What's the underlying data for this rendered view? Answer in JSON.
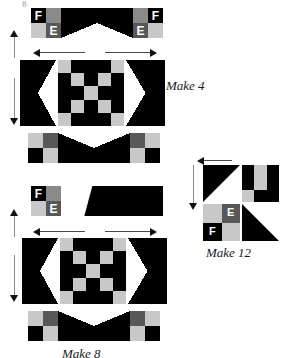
{
  "page": {
    "background": "#ffffff",
    "width": 286,
    "height": 358,
    "corner_mark": "8"
  },
  "palette": {
    "black": "#000000",
    "white": "#ffffff",
    "light_gray": "#c8c8c8",
    "medium_gray": "#8a8a8a",
    "dark_gray": "#585858",
    "arrow": "#111111",
    "caption_text": "#1a1a1a"
  },
  "patch_labels": {
    "f": "F",
    "e": "E"
  },
  "blocks": [
    {
      "id": "make-4",
      "caption": "Make 4",
      "rows": [
        {
          "name": "top-sashing-strip",
          "segments": [
            "four-patch-FE",
            "flying-geese-down",
            "four-patch-FE-mirrored"
          ]
        },
        {
          "name": "center-row",
          "segments": [
            "flying-geese-right",
            "checkerboard-5x5",
            "flying-geese-left"
          ]
        },
        {
          "name": "bottom-sashing-strip",
          "segments": [
            "four-patch",
            "flying-geese-up",
            "four-patch"
          ]
        }
      ]
    },
    {
      "id": "make-8",
      "caption": "Make 8",
      "rows": [
        {
          "name": "top-sashing-strip",
          "segments": [
            "four-patch-FE",
            "long-diagonal-black"
          ]
        },
        {
          "name": "center-row",
          "segments": [
            "flying-geese-right",
            "checkerboard-5x5",
            "flying-geese-left"
          ]
        },
        {
          "name": "bottom-sashing-strip",
          "segments": [
            "four-patch",
            "flying-geese-up",
            "four-patch"
          ]
        }
      ]
    },
    {
      "id": "make-12",
      "caption": "Make 12",
      "rows": [
        {
          "name": "top-row",
          "segments": [
            "half-square-triangle",
            "nine-patch"
          ]
        },
        {
          "name": "bottom-row",
          "segments": [
            "four-patch-EF",
            "half-square-triangle"
          ]
        }
      ]
    }
  ],
  "checkerboard": {
    "grid": 5,
    "pattern": [
      [
        "g",
        "k",
        "k",
        "k",
        "g"
      ],
      [
        "k",
        "g",
        "k",
        "g",
        "k"
      ],
      [
        "k",
        "k",
        "g",
        "k",
        "k"
      ],
      [
        "k",
        "g",
        "k",
        "g",
        "k"
      ],
      [
        "g",
        "k",
        "k",
        "k",
        "g"
      ]
    ],
    "legend": {
      "k": "black",
      "g": "light_gray"
    }
  },
  "nine_patch": {
    "grid": 3,
    "pattern": [
      [
        "k",
        "g",
        "k"
      ],
      [
        "k",
        "g",
        "k"
      ],
      [
        "g",
        "k",
        "k"
      ]
    ]
  },
  "four_patch_top": {
    "cells": [
      "black",
      "medium_gray",
      "light_gray",
      "dark_gray"
    ],
    "labels": {
      "top_left": "F",
      "bottom_right": "E"
    }
  },
  "four_patch_bottom": {
    "cells": [
      "light_gray",
      "dark_gray",
      "black",
      "light_gray"
    ]
  },
  "four_patch_make12": {
    "cells": [
      "light_gray",
      "dark_gray",
      "black",
      "light_gray"
    ],
    "labels": {
      "top_right": "E",
      "bottom_left": "F"
    }
  },
  "arrows": [
    {
      "id": "make4-left-vertical",
      "direction": "up",
      "orientation": "vertical"
    },
    {
      "id": "make4-top-horizontal",
      "direction": "both",
      "orientation": "horizontal"
    },
    {
      "id": "make4-left-down",
      "direction": "down",
      "orientation": "vertical"
    },
    {
      "id": "make8-left-vertical",
      "direction": "up",
      "orientation": "vertical"
    },
    {
      "id": "make8-top-horizontal",
      "direction": "both",
      "orientation": "horizontal"
    },
    {
      "id": "make8-left-down",
      "direction": "down",
      "orientation": "vertical"
    },
    {
      "id": "make12-top-horizontal",
      "direction": "left",
      "orientation": "horizontal"
    },
    {
      "id": "make12-left-vertical",
      "direction": "down",
      "orientation": "vertical"
    }
  ]
}
